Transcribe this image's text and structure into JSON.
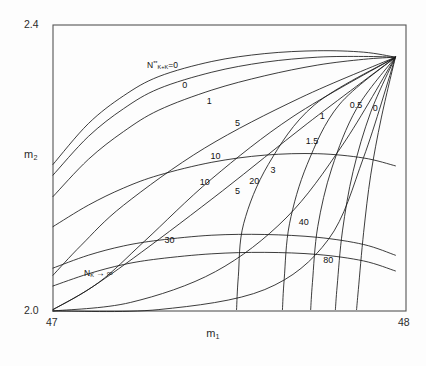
{
  "figure": {
    "background": "#fdfdfd",
    "frame_color": "#555555",
    "curve_color": "#1a1a1a"
  },
  "axes": {
    "xlabel": "m",
    "xlabel_sub": "1",
    "ylabel": "m",
    "ylabel_sub": "2",
    "xticks": [
      "47",
      "48"
    ],
    "yticks": [
      "2.0",
      "2.4"
    ],
    "xlim": [
      47,
      48
    ],
    "ylim": [
      2.0,
      2.4
    ],
    "grid": false
  },
  "annotations": {
    "family_a_head": "N",
    "family_a_sup": "**",
    "family_a_sub": "K+K",
    "family_a_tail": "=0",
    "family_b_head": "N",
    "family_b_sub": "K",
    "family_b_tail": "→ ∞"
  },
  "chart_data": {
    "type": "line",
    "title": "",
    "xlabel": "m_1",
    "ylabel": "m_2",
    "xlim": [
      47,
      48
    ],
    "ylim": [
      2.0,
      2.4
    ],
    "grid": false,
    "legend_position": "inline-curve-labels",
    "convergence_point": [
      47.97,
      2.355
    ],
    "series": [
      {
        "name": "A-0",
        "family": "N**_{K+K}=0",
        "label": "0",
        "label_xy": [
          47.38,
          2.315
        ],
        "points": [
          [
            47.0,
            2.205
          ],
          [
            47.1,
            2.262
          ],
          [
            47.2,
            2.301
          ],
          [
            47.3,
            2.328
          ],
          [
            47.45,
            2.349
          ],
          [
            47.6,
            2.36
          ],
          [
            47.75,
            2.364
          ],
          [
            47.88,
            2.362
          ],
          [
            47.97,
            2.355
          ]
        ]
      },
      {
        "name": "A-1",
        "family": "N**_{K+K}=0",
        "label": "1",
        "label_xy": [
          47.45,
          2.292
        ],
        "points": [
          [
            47.0,
            2.19
          ],
          [
            47.1,
            2.244
          ],
          [
            47.2,
            2.283
          ],
          [
            47.3,
            2.311
          ],
          [
            47.45,
            2.334
          ],
          [
            47.6,
            2.348
          ],
          [
            47.75,
            2.355
          ],
          [
            47.88,
            2.356
          ],
          [
            47.97,
            2.355
          ]
        ]
      },
      {
        "name": "A-5",
        "family": "N**_{K+K}=0",
        "label": "5",
        "label_xy": [
          47.53,
          2.262
        ],
        "points": [
          [
            47.0,
            2.16
          ],
          [
            47.1,
            2.212
          ],
          [
            47.2,
            2.251
          ],
          [
            47.3,
            2.281
          ],
          [
            47.45,
            2.309
          ],
          [
            47.6,
            2.329
          ],
          [
            47.75,
            2.344
          ],
          [
            47.88,
            2.352
          ],
          [
            47.97,
            2.355
          ]
        ]
      },
      {
        "name": "A-10",
        "family": "N**_{K+K}=0",
        "label": "10",
        "label_xy": [
          47.43,
          2.179
        ],
        "points": [
          [
            47.0,
            2.118
          ],
          [
            47.1,
            2.148
          ],
          [
            47.2,
            2.172
          ],
          [
            47.3,
            2.19
          ],
          [
            47.45,
            2.208
          ],
          [
            47.6,
            2.218
          ],
          [
            47.75,
            2.22
          ],
          [
            47.88,
            2.214
          ],
          [
            47.97,
            2.203
          ]
        ]
      },
      {
        "name": "A-30",
        "family": "N**_{K+K}=0",
        "label": "30",
        "label_xy": [
          47.33,
          2.098
        ],
        "points": [
          [
            47.0,
            2.06
          ],
          [
            47.1,
            2.078
          ],
          [
            47.2,
            2.091
          ],
          [
            47.3,
            2.099
          ],
          [
            47.45,
            2.106
          ],
          [
            47.6,
            2.107
          ],
          [
            47.75,
            2.103
          ],
          [
            47.88,
            2.093
          ],
          [
            47.97,
            2.078
          ]
        ]
      },
      {
        "name": "A-inf",
        "family": "N_K -> inf",
        "label": "",
        "label_xy": [
          47.3,
          2.058
        ],
        "points": [
          [
            47.0,
            2.035
          ],
          [
            47.1,
            2.052
          ],
          [
            47.2,
            2.065
          ],
          [
            47.3,
            2.073
          ],
          [
            47.45,
            2.08
          ],
          [
            47.6,
            2.082
          ],
          [
            47.75,
            2.079
          ],
          [
            47.88,
            2.07
          ],
          [
            47.97,
            2.056
          ]
        ]
      },
      {
        "name": "B-0",
        "family": "right-fan",
        "label": "0",
        "label_xy": [
          47.92,
          2.283
        ],
        "points": [
          [
            47.97,
            2.355
          ],
          [
            47.93,
            2.27
          ],
          [
            47.9,
            2.19
          ],
          [
            47.88,
            2.11
          ],
          [
            47.865,
            2.03
          ],
          [
            47.86,
            2.002
          ]
        ]
      },
      {
        "name": "B-0.5",
        "family": "right-fan",
        "label": "0.5",
        "label_xy": [
          47.855,
          2.287
        ],
        "points": [
          [
            47.97,
            2.355
          ],
          [
            47.9,
            2.278
          ],
          [
            47.85,
            2.195
          ],
          [
            47.82,
            2.112
          ],
          [
            47.805,
            2.035
          ],
          [
            47.8,
            2.002
          ]
        ]
      },
      {
        "name": "B-1",
        "family": "right-fan",
        "label": "1",
        "label_xy": [
          47.77,
          2.272
        ],
        "points": [
          [
            47.97,
            2.355
          ],
          [
            47.86,
            2.283
          ],
          [
            47.79,
            2.2
          ],
          [
            47.75,
            2.118
          ],
          [
            47.735,
            2.04
          ],
          [
            47.73,
            2.002
          ]
        ]
      },
      {
        "name": "B-1.5",
        "family": "right-fan",
        "label": "1.5",
        "label_xy": [
          47.73,
          2.236
        ],
        "points": [
          [
            47.97,
            2.355
          ],
          [
            47.81,
            2.288
          ],
          [
            47.72,
            2.205
          ],
          [
            47.67,
            2.122
          ],
          [
            47.655,
            2.045
          ],
          [
            47.65,
            2.002
          ]
        ]
      },
      {
        "name": "B-3",
        "family": "right-fan",
        "label": "3",
        "label_xy": [
          47.63,
          2.196
        ],
        "points": [
          [
            47.97,
            2.355
          ],
          [
            47.74,
            2.288
          ],
          [
            47.61,
            2.205
          ],
          [
            47.54,
            2.122
          ],
          [
            47.525,
            2.048
          ],
          [
            47.52,
            2.002
          ]
        ]
      },
      {
        "name": "B-5",
        "family": "diag",
        "label": "5",
        "label_xy": [
          47.53,
          2.166
        ],
        "points": [
          [
            47.97,
            2.355
          ],
          [
            47.68,
            2.272
          ],
          [
            47.45,
            2.185
          ],
          [
            47.26,
            2.098
          ],
          [
            47.13,
            2.04
          ],
          [
            47.0,
            2.002
          ]
        ]
      },
      {
        "name": "B-10",
        "family": "diag",
        "label": "10",
        "label_xy": [
          47.46,
          2.215
        ],
        "points": [
          [
            47.97,
            2.355
          ],
          [
            47.7,
            2.298
          ],
          [
            47.43,
            2.228
          ],
          [
            47.2,
            2.148
          ],
          [
            47.08,
            2.092
          ],
          [
            47.0,
            2.05
          ]
        ]
      },
      {
        "name": "B-20",
        "family": "diag",
        "label": "20",
        "label_xy": [
          47.57,
          2.18
        ],
        "points": [
          [
            47.97,
            2.355
          ],
          [
            47.72,
            2.262
          ],
          [
            47.48,
            2.168
          ],
          [
            47.25,
            2.082
          ],
          [
            47.1,
            2.03
          ],
          [
            47.0,
            2.002
          ]
        ]
      },
      {
        "name": "B-40",
        "family": "diag",
        "label": "40",
        "label_xy": [
          47.71,
          2.123
        ],
        "points": [
          [
            47.97,
            2.355
          ],
          [
            47.82,
            2.232
          ],
          [
            47.66,
            2.13
          ],
          [
            47.46,
            2.055
          ],
          [
            47.22,
            2.012
          ],
          [
            47.0,
            2.0
          ]
        ]
      },
      {
        "name": "B-80",
        "family": "diag",
        "label": "80",
        "label_xy": [
          47.78,
          2.07
        ],
        "points": [
          [
            47.97,
            2.355
          ],
          [
            47.88,
            2.215
          ],
          [
            47.78,
            2.1
          ],
          [
            47.6,
            2.03
          ],
          [
            47.3,
            2.002
          ],
          [
            47.0,
            1.999
          ]
        ]
      }
    ]
  }
}
